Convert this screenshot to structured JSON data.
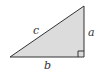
{
  "diagram": {
    "type": "right-triangle",
    "fill_color": "#dcdcdc",
    "stroke_color": "#333333",
    "vertices": {
      "bottom_left": [
        10,
        57
      ],
      "bottom_right": [
        84,
        57
      ],
      "top": [
        84,
        6
      ]
    },
    "right_angle_marker": {
      "corner": "bottom_right",
      "size": 6
    },
    "labels": {
      "hypotenuse": "c",
      "vertical_leg": "a",
      "horizontal_leg": "b"
    }
  }
}
